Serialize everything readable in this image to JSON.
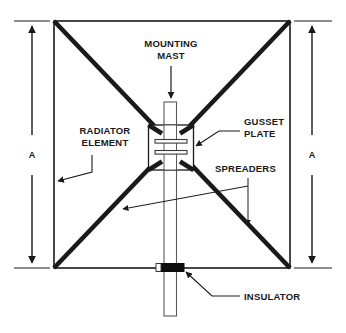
{
  "diagram": {
    "background_color": "#ffffff",
    "line_color": "#1a1a1a",
    "thin_line_color": "#4a4a4a",
    "labels": {
      "mounting_mast_line1": "MOUNTING",
      "mounting_mast_line2": "MAST",
      "radiator_element_line1": "RADIATOR",
      "radiator_element_line2": "ELEMENT",
      "gusset_plate_line1": "GUSSET",
      "gusset_plate_line2": "PLATE",
      "spreaders": "SPREADERS",
      "insulator": "INSULATOR",
      "dimension_left": "A",
      "dimension_right": "A"
    },
    "parts": [
      {
        "name": "mounting-mast",
        "label": "MOUNTING MAST"
      },
      {
        "name": "radiator-element",
        "label": "RADIATOR ELEMENT"
      },
      {
        "name": "gusset-plate",
        "label": "GUSSET PLATE"
      },
      {
        "name": "spreaders",
        "label": "SPREADERS"
      },
      {
        "name": "insulator",
        "label": "INSULATOR"
      }
    ],
    "dimensions": [
      {
        "name": "height-left",
        "label": "A"
      },
      {
        "name": "height-right",
        "label": "A"
      }
    ]
  }
}
